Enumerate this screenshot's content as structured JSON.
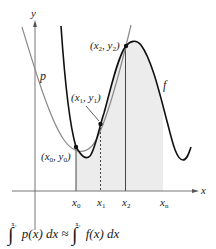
{
  "figure": {
    "axes": {
      "x_label": "x",
      "y_label": "y"
    },
    "curves": {
      "p_label": "p",
      "f_label": "f"
    },
    "points": {
      "p0": {
        "x_text": "(x",
        "sub0": "0",
        "sep": ", y",
        "sub0b": "0",
        "close": ")"
      },
      "p1": {
        "x_text": "(x",
        "sub": "1",
        "sep": ", y",
        "subb": "1",
        "close": ")"
      },
      "p2": {
        "x_text": "(x",
        "sub": "2",
        "sep": ", y",
        "subb": "2",
        "close": ")"
      }
    },
    "ticks": [
      {
        "base": "x",
        "sub": "0"
      },
      {
        "base": "x",
        "sub": "1"
      },
      {
        "base": "x",
        "sub": "2"
      },
      {
        "base": "x",
        "sub": "n"
      }
    ],
    "formula": {
      "upper_limit": "x₂",
      "lower_limit": "x₀",
      "lhs": "p(x) dx",
      "approx": "≈",
      "rhs": "f(x) dx"
    },
    "colors": {
      "f_curve": "#111111",
      "p_curve": "#8a8a8a",
      "shade": "#ececec",
      "axis": "#555555"
    }
  }
}
